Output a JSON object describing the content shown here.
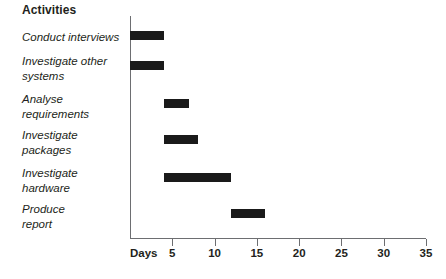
{
  "heading": "Activities",
  "axis": {
    "x_title": "Days",
    "tick_labels": [
      "5",
      "10",
      "15",
      "20",
      "25",
      "30",
      "35"
    ]
  },
  "chart_data": {
    "type": "bar",
    "subtype": "gantt",
    "title": "Activities",
    "xlabel": "Days",
    "ylabel": "",
    "xlim": [
      0,
      35
    ],
    "xticks": [
      0,
      5,
      10,
      15,
      20,
      25,
      30,
      35
    ],
    "grid": false,
    "legend": "none",
    "bar_color": "#1a1a1a",
    "axis_color": "#6d6e71",
    "categories": [
      "Conduct interviews",
      "Investigate other systems",
      "Analyse requirements",
      "Investigate packages",
      "Investigate hardware",
      "Produce report"
    ],
    "tasks": [
      {
        "label": "Conduct interviews",
        "label_lines": "Conduct interviews",
        "start": 0,
        "end": 4,
        "duration": 4
      },
      {
        "label": "Investigate other systems",
        "label_lines": "Investigate other\nsystems",
        "start": 0,
        "end": 4,
        "duration": 4
      },
      {
        "label": "Analyse requirements",
        "label_lines": "Analyse\nrequirements",
        "start": 4,
        "end": 7,
        "duration": 3
      },
      {
        "label": "Investigate packages",
        "label_lines": "Investigate\npackages",
        "start": 4,
        "end": 8,
        "duration": 4
      },
      {
        "label": "Investigate hardware",
        "label_lines": "Investigate\nhardware",
        "start": 4,
        "end": 12,
        "duration": 8
      },
      {
        "label": "Produce report",
        "label_lines": "Produce\nreport",
        "start": 12,
        "end": 16,
        "duration": 4
      }
    ]
  }
}
